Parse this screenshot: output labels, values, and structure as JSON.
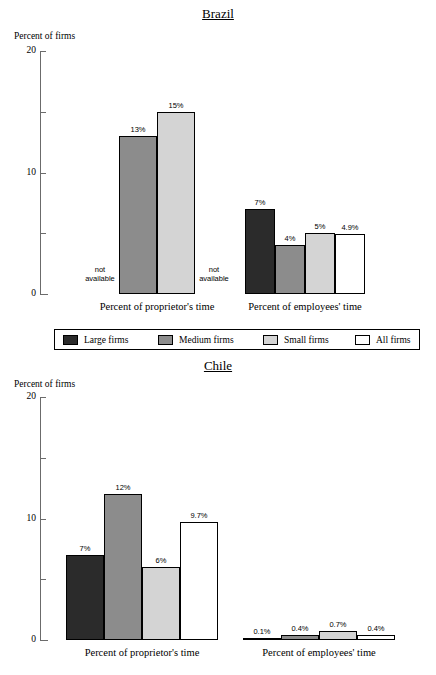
{
  "legend": {
    "items": [
      {
        "label": "Large firms",
        "color": "#2b2b2b"
      },
      {
        "label": "Medium firms",
        "color": "#8c8c8c"
      },
      {
        "label": "Small firms",
        "color": "#d4d4d4"
      },
      {
        "label": "All firms",
        "color": "#ffffff"
      }
    ]
  },
  "chart_data": [
    {
      "type": "bar",
      "title": "Brazil",
      "ylabel": "Percent of firms",
      "xlabel": "",
      "ylim": [
        0,
        20
      ],
      "yticks": [
        0,
        5,
        10,
        15,
        20
      ],
      "ytick_labels": [
        "0",
        "",
        "10",
        "",
        "20"
      ],
      "grid": false,
      "legend_position": "bottom",
      "series": [
        "Large firms",
        "Medium firms",
        "Small firms",
        "All firms"
      ],
      "groups": [
        {
          "name": "Percent of proprietor's time",
          "values": [
            null,
            13,
            15,
            null
          ],
          "labels": [
            "not available",
            "13%",
            "15%",
            "not available"
          ]
        },
        {
          "name": "Percent of employees' time",
          "values": [
            7,
            4,
            5,
            4.9
          ],
          "labels": [
            "7%",
            "4%",
            "5%",
            "4.9%"
          ]
        }
      ]
    },
    {
      "type": "bar",
      "title": "Chile",
      "ylabel": "Percent of firms",
      "xlabel": "",
      "ylim": [
        0,
        20
      ],
      "yticks": [
        0,
        5,
        10,
        15,
        20
      ],
      "ytick_labels": [
        "0",
        "",
        "10",
        "",
        "20"
      ],
      "grid": false,
      "legend_position": "none",
      "series": [
        "Large firms",
        "Medium firms",
        "Small firms",
        "All firms"
      ],
      "groups": [
        {
          "name": "Percent of proprietor's time",
          "values": [
            7,
            12,
            6,
            9.7
          ],
          "labels": [
            "7%",
            "12%",
            "6%",
            "9.7%"
          ]
        },
        {
          "name": "Percent of employees' time",
          "values": [
            0.1,
            0.4,
            0.7,
            0.4
          ],
          "labels": [
            "0.1%",
            "0.4%",
            "0.7%",
            "0.4%"
          ]
        }
      ]
    }
  ]
}
